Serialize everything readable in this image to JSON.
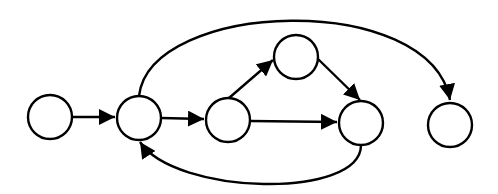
{
  "diagram": {
    "type": "directed-graph",
    "colors": {
      "stroke": "#000000",
      "fill": "#ffffff",
      "background": "#ffffff"
    },
    "nodes": [
      {
        "id": "n1",
        "label": ""
      },
      {
        "id": "n2",
        "label": ""
      },
      {
        "id": "n3",
        "label": ""
      },
      {
        "id": "n4",
        "label": ""
      },
      {
        "id": "n5",
        "label": ""
      },
      {
        "id": "n6",
        "label": ""
      }
    ],
    "edges": [
      {
        "from": "n1",
        "to": "n2",
        "shape": "straight"
      },
      {
        "from": "n2",
        "to": "n3",
        "shape": "straight"
      },
      {
        "from": "n3",
        "to": "n4",
        "shape": "straight"
      },
      {
        "from": "n3",
        "to": "n5",
        "shape": "straight"
      },
      {
        "from": "n4",
        "to": "n5",
        "shape": "straight"
      },
      {
        "from": "n5",
        "to": "n2",
        "shape": "curved-below"
      },
      {
        "from": "n2",
        "to": "n6",
        "shape": "curved-above"
      }
    ]
  }
}
